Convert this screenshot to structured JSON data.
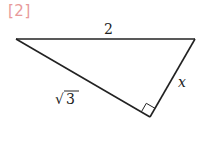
{
  "problem_label": "[2]",
  "triangle": {
    "sides": {
      "top": "2",
      "right": "x",
      "left": "√",
      "left_radicand": "3"
    },
    "right_angle_at": "bottom vertex",
    "colors": {
      "line": "#222222",
      "label": "#e89a9a"
    }
  }
}
